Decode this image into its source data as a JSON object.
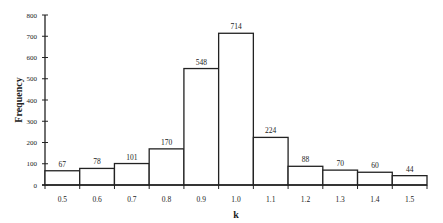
{
  "chart_data": {
    "type": "bar",
    "title": "",
    "xlabel": "k",
    "ylabel": "Frequency",
    "categories": [
      "0.5",
      "0.6",
      "0.7",
      "0.8",
      "0.9",
      "1.0",
      "1.1",
      "1.2",
      "1.3",
      "1.4",
      "1.5"
    ],
    "values": [
      67,
      78,
      101,
      170,
      548,
      714,
      224,
      88,
      70,
      60,
      44
    ],
    "ylim": [
      0,
      800
    ],
    "yticks": [
      0,
      100,
      200,
      300,
      400,
      500,
      600,
      700,
      800
    ],
    "grid": false,
    "legend": null,
    "data_labels": true
  }
}
